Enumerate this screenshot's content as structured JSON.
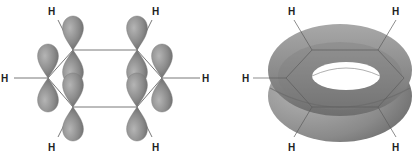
{
  "diagram": {
    "left_panel": {
      "description": "benzene p-orbitals",
      "hydrogen_label": "H",
      "hydrogens": [
        {
          "label": "H",
          "x": 52,
          "y": 14
        },
        {
          "label": "H",
          "x": 155,
          "y": 14
        },
        {
          "label": "H",
          "x": 3,
          "y": 82
        },
        {
          "label": "H",
          "x": 202,
          "y": 82
        },
        {
          "label": "H",
          "x": 52,
          "y": 150
        },
        {
          "label": "H",
          "x": 155,
          "y": 150
        }
      ],
      "lobe_color": "#8a8a8a"
    },
    "right_panel": {
      "description": "delocalized pi electron cloud (torus)",
      "hydrogen_label": "H",
      "hydrogens": [
        {
          "label": "H",
          "x": 290,
          "y": 14
        },
        {
          "label": "H",
          "x": 394,
          "y": 14
        },
        {
          "label": "H",
          "x": 242,
          "y": 82
        },
        {
          "label": "H",
          "x": 290,
          "y": 150
        },
        {
          "label": "H",
          "x": 394,
          "y": 150
        }
      ],
      "torus_color": "#9a9a9a"
    }
  }
}
